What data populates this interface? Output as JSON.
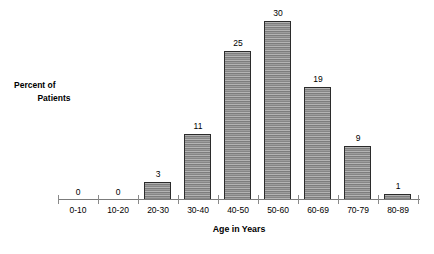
{
  "chart_data": {
    "type": "bar",
    "title": "",
    "subtitle": "",
    "xlabel": "Age in Years",
    "ylabel": "Percent of Patients",
    "ylabel_lines": [
      "Percent of",
      "Patients"
    ],
    "categories": [
      "0-10",
      "10-20",
      "20-30",
      "30-40",
      "40-50",
      "50-60",
      "60-69",
      "70-79",
      "80-89"
    ],
    "values": [
      0,
      0,
      3,
      11,
      25,
      30,
      19,
      9,
      1
    ],
    "value_labels": [
      "0",
      "0",
      "3",
      "11",
      "25",
      "30",
      "19",
      "9",
      "1"
    ],
    "ylim": [
      0,
      32
    ],
    "yticks_visible": false,
    "grid": false,
    "legend": null,
    "bar_fill": "#9a9a9a",
    "bar_stripe_light": "#b4b4b4",
    "bar_stripe_dark": "#7d7d7d",
    "bar_outline": "#2b2b2b",
    "axis_color": "#7b7b7b",
    "background": "#ffffff",
    "annotations": []
  },
  "bottom_bleed": {
    "text": "."
  }
}
